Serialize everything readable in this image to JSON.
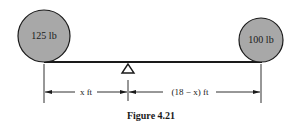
{
  "figure": {
    "caption": "Figure 4.21",
    "left_weight": {
      "label": "125 lb",
      "fill": "#a8a8a8"
    },
    "right_weight": {
      "label": "100 lb",
      "fill": "#a8a8a8"
    },
    "left_dimension": "x ft",
    "right_dimension": "(18 − x) ft",
    "fulcrum": "triangle-fulcrum",
    "colors": {
      "line": "#1a1a1a",
      "weight_fill": "#a8a8a8"
    }
  }
}
